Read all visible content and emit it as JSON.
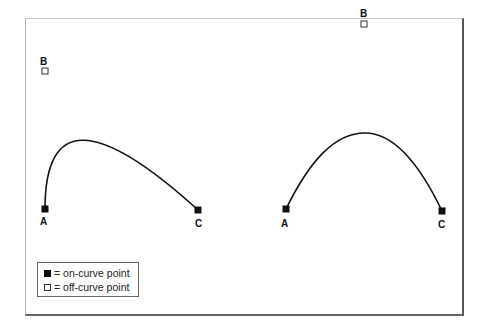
{
  "diagrams": [
    {
      "name": "left-curve",
      "points": {
        "A": {
          "label": "A",
          "type": "on-curve"
        },
        "B": {
          "label": "B",
          "type": "off-curve"
        },
        "C": {
          "label": "C",
          "type": "on-curve"
        }
      }
    },
    {
      "name": "right-curve",
      "points": {
        "A": {
          "label": "A",
          "type": "on-curve"
        },
        "B": {
          "label": "B",
          "type": "off-curve"
        },
        "C": {
          "label": "C",
          "type": "on-curve"
        }
      }
    }
  ],
  "legend": {
    "on_curve": "= on-curve point",
    "off_curve": "= off-curve point"
  },
  "colors": {
    "stroke": "#111111",
    "frame": "#555555"
  }
}
